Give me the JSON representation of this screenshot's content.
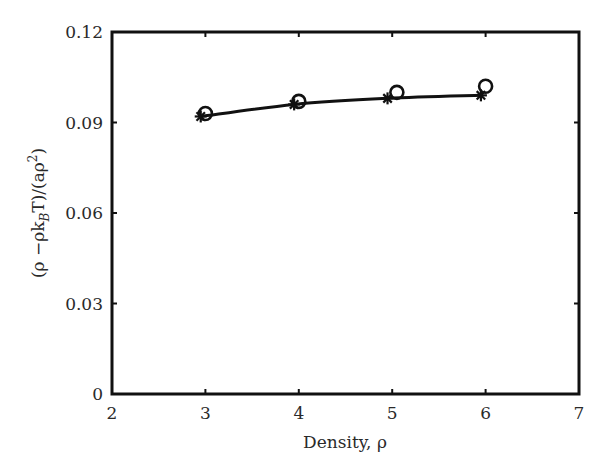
{
  "chart_data": {
    "type": "line",
    "title": "",
    "xlabel": "Density, ρ",
    "ylabel": "(ρ −ρk_BT)/(aρ²)",
    "xlim": [
      2,
      7
    ],
    "ylim": [
      0,
      0.12
    ],
    "xticks": [
      2,
      3,
      4,
      5,
      6,
      7
    ],
    "yticks": [
      0,
      0.03,
      0.06,
      0.09,
      0.12
    ],
    "xtick_labels": [
      "2",
      "3",
      "4",
      "5",
      "6",
      "7"
    ],
    "ytick_labels": [
      "0",
      "0.03",
      "0.06",
      "0.09",
      "0.12"
    ],
    "grid": false,
    "legend": null,
    "series": [
      {
        "name": "theory (line with asterisks)",
        "marker": "asterisk",
        "line": true,
        "x": [
          2.95,
          3.95,
          4.95,
          5.95
        ],
        "values": [
          0.092,
          0.096,
          0.098,
          0.099
        ]
      },
      {
        "name": "simulation (circles)",
        "marker": "circle",
        "line": false,
        "x": [
          3.0,
          4.0,
          5.05,
          6.0
        ],
        "values": [
          0.093,
          0.097,
          0.1,
          0.102
        ]
      }
    ]
  },
  "axes": {
    "x_label_text": "Density, ρ",
    "y_label_prefix": "(ρ −ρk",
    "y_label_sub": "B",
    "y_label_mid": "T)/(aρ",
    "y_label_sup": "2",
    "y_label_suffix": ")"
  }
}
